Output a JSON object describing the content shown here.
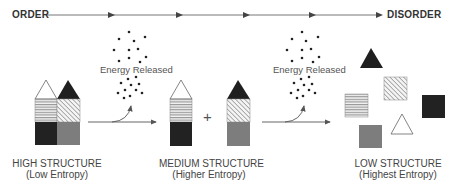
{
  "axis": {
    "start_label": "ORDER",
    "end_label": "DISORDER"
  },
  "energy_labels": [
    "Energy Released",
    "Energy Released"
  ],
  "operator": "+",
  "stages": [
    {
      "title": "HIGH STRUCTURE",
      "subtitle": "(Low Entropy)"
    },
    {
      "title": "MEDIUM STRUCTURE",
      "subtitle": "(Higher Entropy)"
    },
    {
      "title": "LOW STRUCTURE",
      "subtitle": "(Highest Entropy)"
    }
  ],
  "colors": {
    "line": "#555555",
    "dark": "#1f1f1f",
    "gray": "#7d7d7d",
    "stripe": "#888888",
    "dot": "#222222"
  }
}
